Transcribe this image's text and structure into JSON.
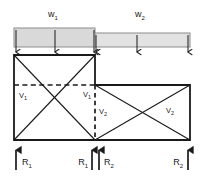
{
  "figure": {
    "background_color": "#ffffff",
    "line_color": "#1a1a1a",
    "load_bar_fill": "#d9d9d9",
    "load_bar_fill_light": "#e2e2e2",
    "load_bar_stroke": "#8c8c8c"
  },
  "loads": [
    {
      "name": "w1",
      "label": "w",
      "subscript": "1",
      "label_x": 53,
      "label_y": 15,
      "bar": {
        "x": 14,
        "y": 28,
        "width": 81,
        "height": 19
      },
      "arrow_xs": [
        16,
        55,
        94
      ],
      "arrow_top": 30,
      "arrow_bottom": 53
    },
    {
      "name": "w2",
      "label": "w",
      "subscript": "2",
      "label_x": 140,
      "label_y": 15,
      "bar": {
        "x": 95,
        "y": 33,
        "width": 95,
        "height": 14
      },
      "arrow_xs": [
        96,
        137,
        188
      ],
      "arrow_top": 35,
      "arrow_bottom": 53
    }
  ],
  "frame": {
    "left_bay": {
      "x1": 14,
      "y1": 55,
      "x2": 95,
      "y2": 140
    },
    "right_bay": {
      "x1": 95,
      "y1": 85,
      "x2": 190,
      "y2": 140
    },
    "dashed_line": {
      "x1": 14,
      "y1": 85,
      "x2": 95,
      "y2": 85
    },
    "dashed_column": {
      "x": 95,
      "y1": 85,
      "y2": 140
    }
  },
  "shear_labels": [
    {
      "name": "v1-left",
      "label": "V",
      "subscript": "1",
      "x": 19,
      "y": 98
    },
    {
      "name": "v1-right",
      "label": "V",
      "subscript": "1",
      "x": 83,
      "y": 97
    },
    {
      "name": "v2-left",
      "label": "V",
      "subscript": "2",
      "x": 99,
      "y": 114
    },
    {
      "name": "v2-right",
      "label": "V",
      "subscript": "2",
      "x": 166,
      "y": 113
    }
  ],
  "reactions": [
    {
      "name": "r1-left",
      "label": "R",
      "subscript": "1",
      "arrow_x": 16,
      "label_x": 22,
      "label_y": 165,
      "label_anchor": "start"
    },
    {
      "name": "r1-center",
      "label": "R",
      "subscript": "1",
      "arrow_x": 92,
      "label_x": 88,
      "label_y": 165,
      "label_anchor": "end"
    },
    {
      "name": "r2-center",
      "label": "R",
      "subscript": "2",
      "arrow_x": 99,
      "label_x": 103,
      "label_y": 165,
      "label_anchor": "start"
    },
    {
      "name": "r2-right",
      "label": "R",
      "subscript": "2",
      "arrow_x": 188,
      "label_x": 183,
      "label_y": 165,
      "label_anchor": "end"
    }
  ],
  "reaction_arrow": {
    "top": 150,
    "bottom": 170
  }
}
